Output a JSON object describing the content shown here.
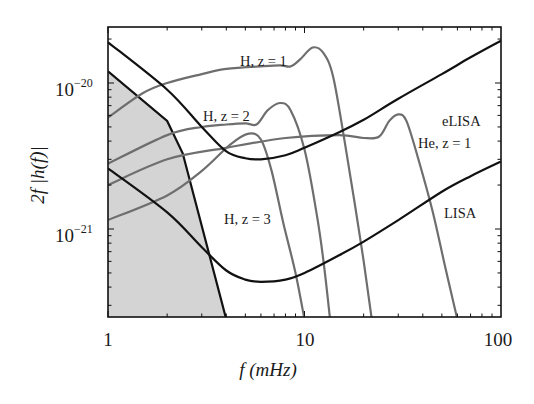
{
  "chart_data": {
    "type": "line",
    "title": "",
    "xlabel": "f (mHz)",
    "ylabel": "2f |h(f)|",
    "xscale": "log",
    "yscale": "log",
    "xlim": [
      1,
      100
    ],
    "ylim": [
      2.4e-22,
      2.4e-20
    ],
    "grid": false,
    "legend": "inline labels",
    "x_ticks": [
      {
        "value": 1,
        "label": "1"
      },
      {
        "value": 10,
        "label": "10"
      },
      {
        "value": 100,
        "label": "100"
      }
    ],
    "y_ticks": [
      {
        "value": 1e-20,
        "base": "10",
        "exp": "−20"
      },
      {
        "value": 1e-21,
        "base": "10",
        "exp": "−21"
      }
    ],
    "shaded_region": {
      "name": "confusion noise",
      "color": "#d4d4d4",
      "boundary": [
        [
          1,
          1.2e-20
        ],
        [
          2,
          5.5e-21
        ],
        [
          2.4,
          3.3e-21
        ],
        [
          4,
          2.4e-22
        ]
      ]
    },
    "series": [
      {
        "name": "eLISA",
        "label": "eLISA",
        "color": "#111111",
        "width": 2.2,
        "label_pos": [
          442,
          126
        ],
        "points": [
          [
            1,
            1.9e-20
          ],
          [
            2,
            9e-21
          ],
          [
            3,
            5e-21
          ],
          [
            4,
            3.4e-21
          ],
          [
            5,
            3.05e-21
          ],
          [
            6,
            3e-21
          ],
          [
            8,
            3.2e-21
          ],
          [
            10,
            3.6e-21
          ],
          [
            15,
            4.6e-21
          ],
          [
            20,
            5.6e-21
          ],
          [
            30,
            7.8e-21
          ],
          [
            50,
            1.15e-20
          ],
          [
            70,
            1.5e-20
          ],
          [
            100,
            1.95e-20
          ]
        ]
      },
      {
        "name": "LISA",
        "label": "LISA",
        "color": "#111111",
        "width": 2.2,
        "label_pos": [
          444,
          218
        ],
        "points": [
          [
            1,
            2.6e-21
          ],
          [
            2,
            1.3e-21
          ],
          [
            3,
            7.5e-22
          ],
          [
            4,
            5.2e-22
          ],
          [
            5,
            4.5e-22
          ],
          [
            6,
            4.35e-22
          ],
          [
            8,
            4.5e-22
          ],
          [
            10,
            5e-22
          ],
          [
            15,
            6.6e-22
          ],
          [
            20,
            8.2e-22
          ],
          [
            30,
            1.15e-21
          ],
          [
            50,
            1.8e-21
          ],
          [
            70,
            2.3e-21
          ],
          [
            100,
            2.9e-21
          ]
        ]
      },
      {
        "name": "H, z=1",
        "label": "H, z = 1",
        "color": "#6e6e6e",
        "width": 2.2,
        "label_pos": [
          240,
          66
        ],
        "points": [
          [
            1,
            5.8e-21
          ],
          [
            1.5,
            8.5e-21
          ],
          [
            2,
            1e-20
          ],
          [
            3,
            1.15e-20
          ],
          [
            4,
            1.25e-20
          ],
          [
            6,
            1.3e-20
          ],
          [
            7.5,
            1.32e-20
          ],
          [
            8.5,
            1.3e-20
          ],
          [
            9.5,
            1.45e-20
          ],
          [
            11,
            1.75e-20
          ],
          [
            12.5,
            1.6e-20
          ],
          [
            14,
            1.1e-20
          ],
          [
            16,
            4e-21
          ],
          [
            18,
            1.5e-21
          ],
          [
            20,
            6e-22
          ],
          [
            22,
            2.4e-22
          ]
        ]
      },
      {
        "name": "H, z=2",
        "label": "H, z = 2",
        "color": "#6e6e6e",
        "width": 2.2,
        "label_pos": [
          203,
          121
        ],
        "points": [
          [
            1,
            2.8e-21
          ],
          [
            2,
            4.4e-21
          ],
          [
            3,
            5e-21
          ],
          [
            4,
            5.2e-21
          ],
          [
            5,
            5.3e-21
          ],
          [
            5.7,
            5.2e-21
          ],
          [
            6.5,
            6.5e-21
          ],
          [
            7.5,
            7.3e-21
          ],
          [
            8.5,
            6.5e-21
          ],
          [
            10,
            3.5e-21
          ],
          [
            11.5,
            1.3e-21
          ],
          [
            12.5,
            6e-22
          ],
          [
            13.5,
            2.4e-22
          ]
        ]
      },
      {
        "name": "H, z=3",
        "label": "H, z = 3",
        "color": "#6e6e6e",
        "width": 2.2,
        "label_pos": [
          224,
          224
        ],
        "points": [
          [
            1,
            1.15e-21
          ],
          [
            2,
            1.7e-21
          ],
          [
            3,
            2.5e-21
          ],
          [
            4.2,
            3.8e-21
          ],
          [
            5.2,
            4.5e-21
          ],
          [
            6,
            4.1e-21
          ],
          [
            6.8,
            2.5e-21
          ],
          [
            7.8,
            1.1e-21
          ],
          [
            9,
            5e-22
          ],
          [
            10,
            2.4e-22
          ]
        ]
      },
      {
        "name": "He, z=1",
        "label": "He, z = 1",
        "color": "#6e6e6e",
        "width": 2.2,
        "label_pos": [
          418,
          148
        ],
        "points": [
          [
            1,
            2e-21
          ],
          [
            2,
            3e-21
          ],
          [
            4,
            3.6e-21
          ],
          [
            8,
            4.2e-21
          ],
          [
            15,
            4.4e-21
          ],
          [
            20,
            4.2e-21
          ],
          [
            24,
            4.3e-21
          ],
          [
            27,
            5.5e-21
          ],
          [
            30,
            6.1e-21
          ],
          [
            33,
            5.5e-21
          ],
          [
            38,
            3e-21
          ],
          [
            45,
            1.3e-21
          ],
          [
            52,
            5.5e-22
          ],
          [
            60,
            2.4e-22
          ]
        ]
      }
    ]
  }
}
